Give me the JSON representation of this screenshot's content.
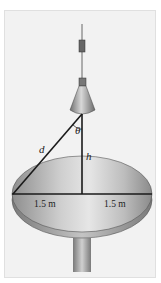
{
  "figure": {
    "labels": {
      "theta": "θ",
      "d": "d",
      "h": "h",
      "left_radius": "1.5 m",
      "right_radius": "1.5 m"
    },
    "colors": {
      "background": "#f2f2f2",
      "disc_light": "#d8d8d8",
      "disc_dark": "#8a8a8a",
      "line": "#1a1a1a"
    }
  }
}
